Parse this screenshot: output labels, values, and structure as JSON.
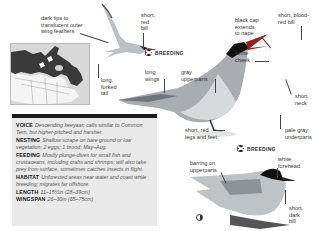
{
  "page": {
    "species_common_alias": "keeyaar",
    "annotations": {
      "flight_wingtips": "dark tips to\ntranslucent outer\nwing feathers",
      "flight_bill": "short,\nred\nbill",
      "flight_tail": "long,\nforked\ntail",
      "long_wings": "long\nwings",
      "gray_upperparts": "gray\nupperparts",
      "black_cap": "black cap\nextends\nto nape",
      "blood_red_bill": "short, blood-\nred bill",
      "white_cheek": "white\ncheek",
      "short_neck": "short\nneck",
      "legs_feet": "short, red\nlegs and feet",
      "pale_underparts": "pale gray\nunderparts",
      "barring": "barring on\nupperparts",
      "white_forehead": "white\nforehead",
      "dark_bill": "short,\ndark\nbill"
    },
    "badges": {
      "flight_breeding": "BREEDING",
      "adult_breeding": "BREEDING"
    },
    "icons": {
      "breeding_icon": "breeding-season-symbol",
      "juvenile_icon": "juvenile-symbol"
    },
    "info": [
      {
        "key": "VOICE",
        "value": "Descending keeyaar; calls similar to Common Tern, but higher-pitched and harsher."
      },
      {
        "key": "NESTING",
        "value": "Shallow scrape on bare ground or low vegetation; 2 eggs; 1 brood; May–Aug."
      },
      {
        "key": "FEEDING",
        "value": "Mostly plunge-dives for small fish and crustaceans, including crabs and shrimps; will also take prey from surface, sometimes catches insects in flight."
      },
      {
        "key": "HABITAT",
        "value": "Unforested areas near water and coast while breeding; migrates far offshore."
      },
      {
        "key": "LENGTH",
        "value": "11–15½in (28–39cm)"
      },
      {
        "key": "WINGSPAN",
        "value": "26–30in (65–75cm)"
      }
    ],
    "colors": {
      "infobox_bg": "#e9e9e9",
      "infobox_bar": "#1a1a1a",
      "map_range": "#3a3a3a",
      "map_bg": "#e6e6e6"
    }
  }
}
